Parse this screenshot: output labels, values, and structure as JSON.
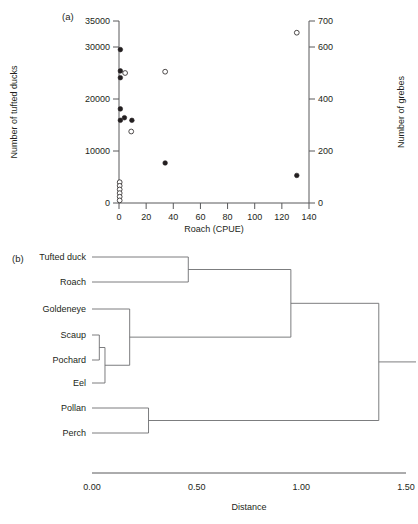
{
  "figure": {
    "panel_a_label": "(a)",
    "panel_b_label": "(b)"
  },
  "chart_data": [
    {
      "type": "scatter",
      "panel": "(a)",
      "title": "",
      "xlabel": "Roach (CPUE)",
      "ylabel": "Number of tufted ducks",
      "y2label": "Number of grebes",
      "xlim": [
        0,
        140
      ],
      "ylim": [
        0,
        35000
      ],
      "y2lim": [
        0,
        700
      ],
      "xticks": [
        0,
        20,
        40,
        60,
        80,
        100,
        120,
        140
      ],
      "xticklabels": [
        "0",
        "20",
        "40",
        "60",
        "80",
        "100",
        "120",
        "140"
      ],
      "yticks": [
        0,
        10000,
        20000,
        30000,
        35000
      ],
      "yticklabels": [
        "0",
        "10000",
        "20000",
        "30000",
        "35000"
      ],
      "y2ticks": [
        0,
        200,
        400,
        600,
        700
      ],
      "y2ticklabels": [
        "0",
        "200",
        "400",
        "600",
        "700"
      ],
      "grid": false,
      "legend": "none",
      "series": [
        {
          "name": "Number of tufted ducks",
          "marker": "filled-circle",
          "axis": "left",
          "points": [
            {
              "x": 1.0,
              "y": 29500
            },
            {
              "x": 1.0,
              "y": 25400
            },
            {
              "x": 1.0,
              "y": 24100
            },
            {
              "x": 1.0,
              "y": 18100
            },
            {
              "x": 1.0,
              "y": 15900
            },
            {
              "x": 4.0,
              "y": 16400
            },
            {
              "x": 9.5,
              "y": 15900
            },
            {
              "x": 34.0,
              "y": 7700
            },
            {
              "x": 131.0,
              "y": 5300
            }
          ]
        },
        {
          "name": "Number of grebes",
          "marker": "open-circle",
          "axis": "right",
          "points": [
            {
              "x": 131.0,
              "y": 655
            },
            {
              "x": 34.0,
              "y": 505
            },
            {
              "x": 4.5,
              "y": 500
            },
            {
              "x": 9.0,
              "y": 275
            },
            {
              "x": 0.5,
              "y": 80
            },
            {
              "x": 0.5,
              "y": 66
            },
            {
              "x": 0.5,
              "y": 52
            },
            {
              "x": 0.5,
              "y": 38
            },
            {
              "x": 0.5,
              "y": 24
            },
            {
              "x": 0.5,
              "y": 10
            }
          ]
        }
      ]
    },
    {
      "type": "dendrogram",
      "panel": "(b)",
      "title": "",
      "xlabel": "Distance",
      "xlim": [
        0,
        1.5
      ],
      "xticks": [
        0.0,
        0.5,
        1.0,
        1.5
      ],
      "xticklabels": [
        "0.00",
        "0.50",
        "1.00",
        "1.50"
      ],
      "grid": false,
      "leaves": [
        "Tufted duck",
        "Roach",
        "Goldeneye",
        "Scaup",
        "Pochard",
        "Eel",
        "Pollan",
        "Perch"
      ],
      "merges": [
        {
          "name": "scaup-pochard",
          "members": [
            "Scaup",
            "Pochard"
          ],
          "height": 0.035
        },
        {
          "name": "scaup-pochard-eel",
          "members": [
            "Scaup",
            "Pochard",
            "Eel"
          ],
          "height": 0.062
        },
        {
          "name": "goldeneye-benthic",
          "members": [
            "Goldeneye",
            "Scaup",
            "Pochard",
            "Eel"
          ],
          "height": 0.18
        },
        {
          "name": "pollan-perch",
          "members": [
            "Pollan",
            "Perch"
          ],
          "height": 0.27
        },
        {
          "name": "tufted-duck-roach",
          "members": [
            "Tufted duck",
            "Roach"
          ],
          "height": 0.46
        },
        {
          "name": "pelagic-benthic",
          "members": [
            "Tufted duck",
            "Roach",
            "Goldeneye",
            "Scaup",
            "Pochard",
            "Eel"
          ],
          "height": 0.95
        },
        {
          "name": "root",
          "members": [
            "Tufted duck",
            "Roach",
            "Goldeneye",
            "Scaup",
            "Pochard",
            "Eel",
            "Pollan",
            "Perch"
          ],
          "height": 1.37
        }
      ]
    }
  ]
}
